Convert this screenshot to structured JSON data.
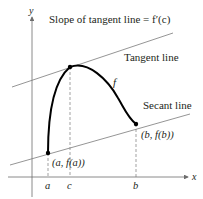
{
  "diagram": {
    "title": "Slope of tangent line = f′(c)",
    "axes": {
      "x_label": "x",
      "y_label": "y"
    },
    "curve_label": "f",
    "tangent_label": "Tangent line",
    "secant_label": "Secant line",
    "point_a_label": "(a, f(a))",
    "point_b_label": "(b, f(b))",
    "tick_a": "a",
    "tick_c": "c",
    "tick_b": "b",
    "colors": {
      "curve": "#000000",
      "lines": "#7a7a7a",
      "axes": "#6d6d6d",
      "text": "#231f20"
    }
  }
}
